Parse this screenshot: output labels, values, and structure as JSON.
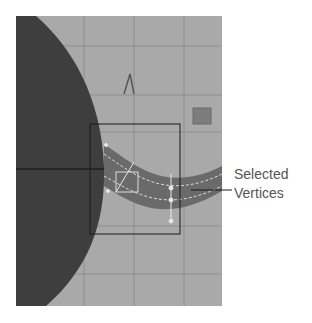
{
  "figure": {
    "viewport": {
      "background": "#a9a9a9",
      "grid_color": "#8e8e8e",
      "sphere_color": "#3e3e3e",
      "tube_color": "#6a6a6a",
      "selection_box_color": "#1a1a1a",
      "cube_color": "#7c7c7c",
      "vertex_color": "#e8e8e8"
    },
    "callout": {
      "line1": "Selected",
      "line2": "Vertices",
      "text_color": "#555555"
    }
  }
}
